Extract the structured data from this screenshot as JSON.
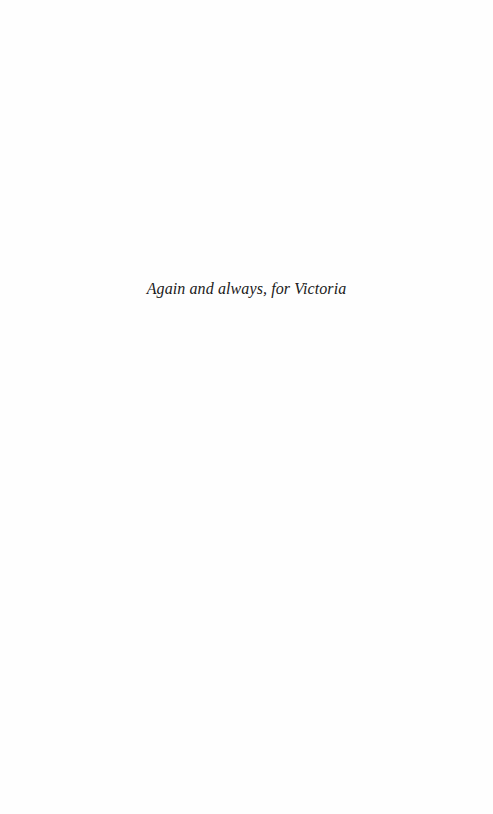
{
  "page": {
    "dedication": "Again and always, for Victoria"
  }
}
